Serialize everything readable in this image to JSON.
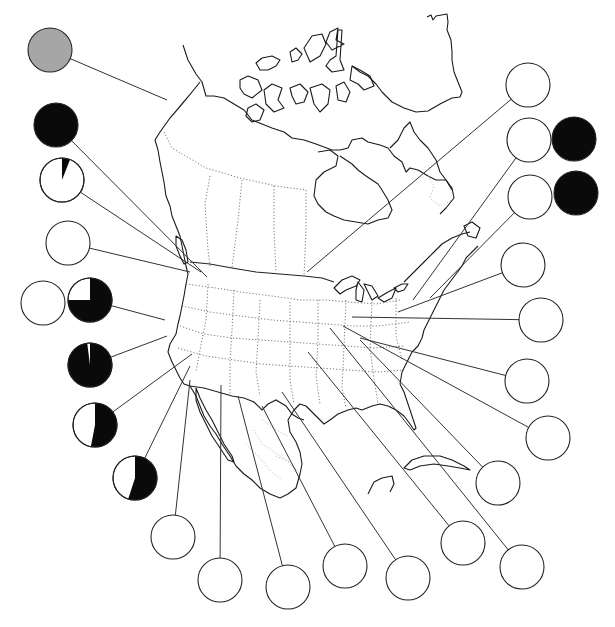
{
  "chart_data": {
    "type": "pie",
    "title": "",
    "colors": {
      "dark": "#0a0a0a",
      "light": "#ffffff",
      "gray": "#a6a6a6",
      "stroke": "#222222"
    },
    "pies": [
      {
        "id": "p1",
        "cx": 50,
        "cy": 50,
        "r": 22,
        "fill": "gray",
        "dark_fraction": null,
        "anchor": [
          167,
          100
        ]
      },
      {
        "id": "p2",
        "cx": 56,
        "cy": 125,
        "r": 22,
        "dark_fraction": 1.0,
        "anchor": [
          207,
          277
        ]
      },
      {
        "id": "p3",
        "cx": 62,
        "cy": 180,
        "r": 22,
        "dark_fraction": 0.06,
        "anchor": [
          201,
          272
        ]
      },
      {
        "id": "p4",
        "cx": 68,
        "cy": 243,
        "r": 22,
        "dark_fraction": 0.0,
        "anchor": [
          190,
          272
        ]
      },
      {
        "id": "p5",
        "cx": 43,
        "cy": 303,
        "r": 22,
        "dark_fraction": 0.0,
        "anchor": null
      },
      {
        "id": "p6",
        "cx": 90,
        "cy": 300,
        "r": 22,
        "dark_fraction": 0.75,
        "anchor": [
          165,
          320
        ]
      },
      {
        "id": "p7",
        "cx": 90,
        "cy": 365,
        "r": 22,
        "dark_fraction": 0.98,
        "anchor": [
          167,
          336
        ]
      },
      {
        "id": "p8",
        "cx": 95,
        "cy": 425,
        "r": 22,
        "dark_fraction": 0.53,
        "anchor": [
          192,
          354
        ]
      },
      {
        "id": "p9",
        "cx": 135,
        "cy": 478,
        "r": 22,
        "dark_fraction": 0.55,
        "anchor": [
          190,
          366
        ]
      },
      {
        "id": "p10",
        "cx": 173,
        "cy": 537,
        "r": 22,
        "dark_fraction": 0.0,
        "anchor": [
          190,
          380
        ]
      },
      {
        "id": "p11",
        "cx": 220,
        "cy": 580,
        "r": 22,
        "dark_fraction": 0.0,
        "anchor": [
          221,
          385
        ]
      },
      {
        "id": "p12",
        "cx": 288,
        "cy": 587,
        "r": 22,
        "dark_fraction": 0.0,
        "anchor": [
          238,
          396
        ]
      },
      {
        "id": "p13",
        "cx": 345,
        "cy": 566,
        "r": 22,
        "dark_fraction": 0.0,
        "anchor": [
          262,
          406
        ]
      },
      {
        "id": "p14",
        "cx": 408,
        "cy": 578,
        "r": 22,
        "dark_fraction": 0.0,
        "anchor": [
          282,
          392
        ]
      },
      {
        "id": "p15",
        "cx": 463,
        "cy": 543,
        "r": 22,
        "dark_fraction": 0.0,
        "anchor": [
          308,
          352
        ]
      },
      {
        "id": "p16",
        "cx": 522,
        "cy": 567,
        "r": 22,
        "dark_fraction": 0.0,
        "anchor": [
          330,
          328
        ]
      },
      {
        "id": "p17",
        "cx": 498,
        "cy": 483,
        "r": 22,
        "dark_fraction": 0.0,
        "anchor": [
          360,
          340
        ]
      },
      {
        "id": "p18",
        "cx": 548,
        "cy": 438,
        "r": 22,
        "dark_fraction": 0.0,
        "anchor": [
          343,
          326
        ]
      },
      {
        "id": "p19",
        "cx": 527,
        "cy": 381,
        "r": 22,
        "dark_fraction": 0.0,
        "anchor": [
          360,
          338
        ]
      },
      {
        "id": "p20",
        "cx": 541,
        "cy": 320,
        "r": 22,
        "dark_fraction": 0.0,
        "anchor": [
          352,
          317
        ]
      },
      {
        "id": "p21",
        "cx": 523,
        "cy": 265,
        "r": 22,
        "dark_fraction": 0.0,
        "anchor": [
          398,
          312
        ]
      },
      {
        "id": "p22",
        "cx": 530,
        "cy": 197,
        "r": 22,
        "dark_fraction": 0.0,
        "anchor": [
          430,
          298
        ]
      },
      {
        "id": "p23",
        "cx": 576,
        "cy": 193,
        "r": 22,
        "dark_fraction": 1.0,
        "anchor": null
      },
      {
        "id": "p24",
        "cx": 529,
        "cy": 140,
        "r": 22,
        "dark_fraction": 0.0,
        "anchor": [
          413,
          300
        ]
      },
      {
        "id": "p25",
        "cx": 574,
        "cy": 139,
        "r": 22,
        "dark_fraction": 1.0,
        "anchor": null
      },
      {
        "id": "p26",
        "cx": 528,
        "cy": 85,
        "r": 22,
        "dark_fraction": 0.0,
        "anchor": [
          307,
          272
        ]
      }
    ],
    "legend": [],
    "xlabel": "",
    "ylabel": ""
  }
}
